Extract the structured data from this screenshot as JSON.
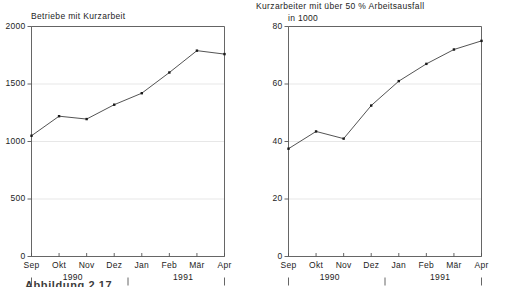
{
  "figure": {
    "caption": "Abbildung 2.17"
  },
  "charts": [
    {
      "id": "betriebe",
      "title": "Betriebe mit Kurzarbeit",
      "unit_label": "",
      "y_ticks": [
        "0",
        "500",
        "1000",
        "1500",
        "2000"
      ],
      "x_ticks": [
        "Sep",
        "Okt",
        "Nov",
        "Dez",
        "Jan",
        "Feb",
        "Mär",
        "Apr"
      ],
      "year_groups": [
        {
          "label": "1990",
          "center_index": 1.5
        },
        {
          "label": "1991",
          "center_index": 5.5
        }
      ]
    },
    {
      "id": "kurzarbeiter",
      "title": "Kurzarbeiter mit über 50 % Arbeitsausfall",
      "unit_label": "in 1000",
      "y_ticks": [
        "0",
        "20",
        "40",
        "60",
        "80"
      ],
      "x_ticks": [
        "Sep",
        "Okt",
        "Nov",
        "Dez",
        "Jan",
        "Feb",
        "Mär",
        "Apr"
      ],
      "year_groups": [
        {
          "label": "1990",
          "center_index": 1.5
        },
        {
          "label": "1991",
          "center_index": 5.5
        }
      ]
    }
  ],
  "chart_data": [
    {
      "type": "line",
      "title": "Betriebe mit Kurzarbeit",
      "subtitle": "",
      "xlabel": "",
      "ylabel": "",
      "categories": [
        "Sep",
        "Okt",
        "Nov",
        "Dez",
        "Jan",
        "Feb",
        "Mär",
        "Apr"
      ],
      "category_years": [
        "1990",
        "1990",
        "1990",
        "1990",
        "1991",
        "1991",
        "1991",
        "1991"
      ],
      "values": [
        1050,
        1220,
        1195,
        1320,
        1420,
        1600,
        1790,
        1760
      ],
      "ylim": [
        0,
        2000
      ],
      "yticks": [
        0,
        500,
        1000,
        1500,
        2000
      ],
      "grid": true,
      "legend": "none",
      "markers": true,
      "line_color": "#404040",
      "marker_color": "#1a1a1a",
      "grid_color": "#dcdcdc",
      "axis_color": "#555555"
    },
    {
      "type": "line",
      "title": "Kurzarbeiter mit über 50 % Arbeitsausfall",
      "subtitle": "in 1000",
      "xlabel": "",
      "ylabel": "in 1000",
      "categories": [
        "Sep",
        "Okt",
        "Nov",
        "Dez",
        "Jan",
        "Feb",
        "Mär",
        "Apr"
      ],
      "category_years": [
        "1990",
        "1990",
        "1990",
        "1990",
        "1991",
        "1991",
        "1991",
        "1991"
      ],
      "values": [
        37.5,
        43.5,
        41.0,
        52.5,
        61.0,
        67.0,
        72.0,
        75.0
      ],
      "ylim": [
        0,
        80
      ],
      "yticks": [
        0,
        20,
        40,
        60,
        80
      ],
      "grid": true,
      "legend": "none",
      "markers": true,
      "line_color": "#404040",
      "marker_color": "#1a1a1a",
      "grid_color": "#dcdcdc",
      "axis_color": "#555555"
    }
  ]
}
